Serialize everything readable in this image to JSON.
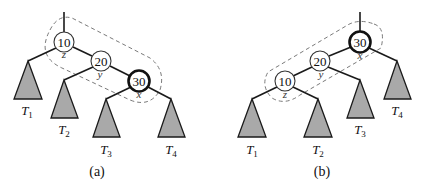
{
  "figure": {
    "panels": [
      {
        "caption": "(a)",
        "nodes": [
          {
            "key": "10",
            "var": "z",
            "bold": false
          },
          {
            "key": "20",
            "var": "y",
            "bold": false
          },
          {
            "key": "30",
            "var": "x",
            "bold": true
          }
        ],
        "subtrees": [
          {
            "name": "T",
            "sub": "1"
          },
          {
            "name": "T",
            "sub": "2"
          },
          {
            "name": "T",
            "sub": "3"
          },
          {
            "name": "T",
            "sub": "4"
          }
        ]
      },
      {
        "caption": "(b)",
        "nodes": [
          {
            "key": "30",
            "var": "x",
            "bold": true
          },
          {
            "key": "20",
            "var": "y",
            "bold": false
          },
          {
            "key": "10",
            "var": "z",
            "bold": false
          }
        ],
        "subtrees": [
          {
            "name": "T",
            "sub": "1"
          },
          {
            "name": "T",
            "sub": "2"
          },
          {
            "name": "T",
            "sub": "3"
          },
          {
            "name": "T",
            "sub": "4"
          }
        ]
      }
    ],
    "colors": {
      "subtree_fill": "#a9a9a9",
      "edge": "#1a1a1a",
      "dashed_outline": "#7a7a7a"
    }
  }
}
